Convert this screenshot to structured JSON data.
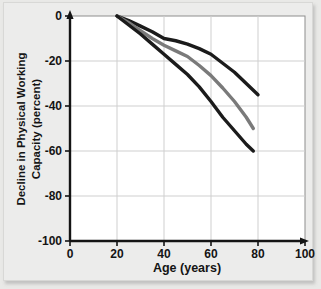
{
  "chart_data": {
    "type": "line",
    "title": "",
    "xlabel": "Age (years)",
    "ylabel": "Decline in Physical Working Capacity (percent)",
    "ylabel_line1": "Decline in Physical Working",
    "ylabel_line2": "Capacity (percent)",
    "xlim": [
      0,
      100
    ],
    "ylim": [
      -100,
      0
    ],
    "xticks": [
      0,
      20,
      40,
      60,
      80,
      100
    ],
    "xtick_labels": [
      "0",
      "20",
      "40",
      "60",
      "80",
      "100"
    ],
    "yticks": [
      0,
      -20,
      -40,
      -60,
      -80,
      -100
    ],
    "ytick_labels": [
      "0",
      "-20",
      "-40",
      "-60",
      "-80",
      "-100"
    ],
    "grid": true,
    "legend": "none",
    "series": [
      {
        "name": "upper-curve",
        "color": "#1b1b1b",
        "x": [
          20,
          25,
          30,
          35,
          40,
          45,
          50,
          55,
          60,
          65,
          70,
          75,
          80
        ],
        "y": [
          0,
          -2,
          -4.5,
          -7,
          -10,
          -11,
          -12.5,
          -14.5,
          -17,
          -21,
          -25,
          -30,
          -35
        ]
      },
      {
        "name": "middle-curve",
        "color": "#7a7a7a",
        "x": [
          20,
          25,
          30,
          35,
          40,
          45,
          50,
          55,
          60,
          65,
          70,
          75,
          78
        ],
        "y": [
          0,
          -3,
          -6.5,
          -10,
          -13,
          -15.5,
          -18,
          -22,
          -26.5,
          -32,
          -38,
          -45,
          -50
        ]
      },
      {
        "name": "lower-curve",
        "color": "#1b1b1b",
        "x": [
          20,
          25,
          30,
          35,
          40,
          45,
          50,
          55,
          60,
          65,
          70,
          75,
          78
        ],
        "y": [
          0,
          -4,
          -8,
          -12.5,
          -17,
          -21.5,
          -26,
          -31.5,
          -38,
          -45,
          -51,
          -57,
          -60
        ]
      }
    ]
  }
}
